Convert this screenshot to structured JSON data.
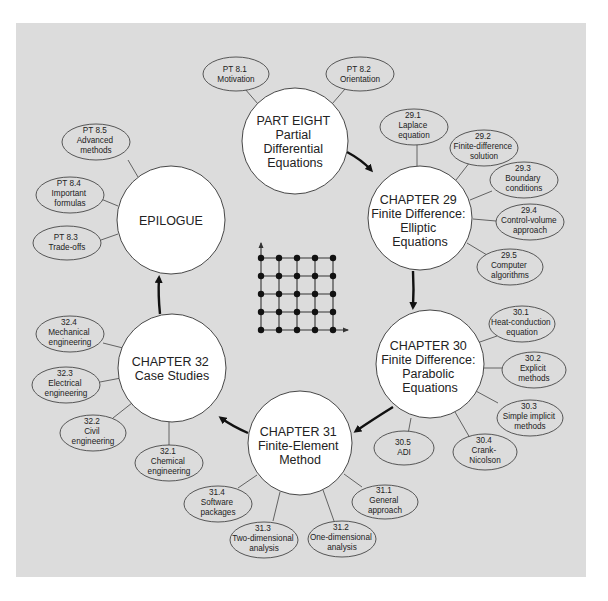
{
  "diagram": {
    "colors": {
      "background": "#dcdcdc",
      "node_fill": "#ffffff",
      "stroke": "#333333",
      "arrow": "#111111"
    },
    "main_nodes": [
      {
        "id": "part8",
        "lines": [
          "PART EIGHT",
          "Partial",
          "Differential",
          "Equations"
        ]
      },
      {
        "id": "ch29",
        "lines": [
          "CHAPTER 29",
          "Finite Difference:",
          "Elliptic",
          "Equations"
        ]
      },
      {
        "id": "ch30",
        "lines": [
          "CHAPTER 30",
          "Finite Difference:",
          "Parabolic",
          "Equations"
        ]
      },
      {
        "id": "ch31",
        "lines": [
          "CHAPTER 31",
          "Finite-Element",
          "Method"
        ]
      },
      {
        "id": "ch32",
        "lines": [
          "CHAPTER 32",
          "Case Studies"
        ]
      },
      {
        "id": "epilogue",
        "lines": [
          "EPILOGUE"
        ]
      }
    ],
    "sub_nodes": {
      "part8": [
        {
          "lines": [
            "PT 8.1",
            "Motivation"
          ]
        },
        {
          "lines": [
            "PT 8.2",
            "Orientation"
          ]
        }
      ],
      "ch29": [
        {
          "lines": [
            "29.1",
            "Laplace",
            "equation"
          ]
        },
        {
          "lines": [
            "29.2",
            "Finite-difference",
            "solution"
          ]
        },
        {
          "lines": [
            "29.3",
            "Boundary",
            "conditions"
          ]
        },
        {
          "lines": [
            "29.4",
            "Control-volume",
            "approach"
          ]
        },
        {
          "lines": [
            "29.5",
            "Computer",
            "algorithms"
          ]
        }
      ],
      "ch30": [
        {
          "lines": [
            "30.1",
            "Heat-conduction",
            "equation"
          ]
        },
        {
          "lines": [
            "30.2",
            "Explicit",
            "methods"
          ]
        },
        {
          "lines": [
            "30.3",
            "Simple implicit",
            "methods"
          ]
        },
        {
          "lines": [
            "30.4",
            "Crank-",
            "Nicolson"
          ]
        },
        {
          "lines": [
            "30.5",
            "ADI"
          ]
        }
      ],
      "ch31": [
        {
          "lines": [
            "31.1",
            "General",
            "approach"
          ]
        },
        {
          "lines": [
            "31.2",
            "One-dimensional",
            "analysis"
          ]
        },
        {
          "lines": [
            "31.3",
            "Two-dimensional",
            "analysis"
          ]
        },
        {
          "lines": [
            "31.4",
            "Software",
            "packages"
          ]
        }
      ],
      "ch32": [
        {
          "lines": [
            "32.1",
            "Chemical",
            "engineering"
          ]
        },
        {
          "lines": [
            "32.2",
            "Civil",
            "engineering"
          ]
        },
        {
          "lines": [
            "32.3",
            "Electrical",
            "engineering"
          ]
        },
        {
          "lines": [
            "32.4",
            "Mechanical",
            "engineering"
          ]
        }
      ],
      "epilogue": [
        {
          "lines": [
            "PT 8.3",
            "Trade-offs"
          ]
        },
        {
          "lines": [
            "PT 8.4",
            "Important",
            "formulas"
          ]
        },
        {
          "lines": [
            "PT 8.5",
            "Advanced",
            "methods"
          ]
        }
      ]
    },
    "center_graphic": {
      "type": "grid",
      "rows": 5,
      "cols": 5,
      "icon": "finite-difference-grid-icon"
    },
    "flow_order": [
      "part8",
      "ch29",
      "ch30",
      "ch31",
      "ch32",
      "epilogue"
    ]
  }
}
